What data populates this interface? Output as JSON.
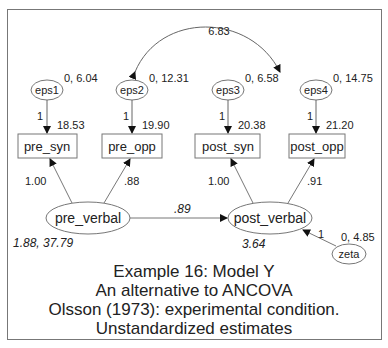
{
  "diagram": {
    "covariance": {
      "from": "eps2",
      "to": "eps4",
      "value": "6.83"
    },
    "errors": [
      {
        "name": "eps1",
        "label": "0, 6.04",
        "path": "1"
      },
      {
        "name": "eps2",
        "label": "0, 12.31",
        "path": "1"
      },
      {
        "name": "eps3",
        "label": "0, 6.58",
        "path": "1"
      },
      {
        "name": "eps4",
        "label": "0, 14.75",
        "path": "1"
      }
    ],
    "observed": [
      {
        "name": "pre_syn",
        "intercept": "18.53",
        "loading": "1.00"
      },
      {
        "name": "pre_opp",
        "intercept": "19.90",
        "loading": ".88"
      },
      {
        "name": "post_syn",
        "intercept": "20.38",
        "loading": "1.00"
      },
      {
        "name": "post_opp",
        "intercept": "21.20",
        "loading": ".91"
      }
    ],
    "latent": [
      {
        "name": "pre_verbal",
        "label": "1.88, 37.79"
      },
      {
        "name": "post_verbal",
        "label": "3.64"
      }
    ],
    "regression": {
      "from": "pre_verbal",
      "to": "post_verbal",
      "value": ".89"
    },
    "disturbance": {
      "name": "zeta",
      "label": "0, 4.85",
      "path": "1"
    }
  },
  "caption": [
    "Example 16:  Model Y",
    "An alternative to ANCOVA",
    "Olsson (1973): experimental condition.",
    "Unstandardized estimates"
  ]
}
